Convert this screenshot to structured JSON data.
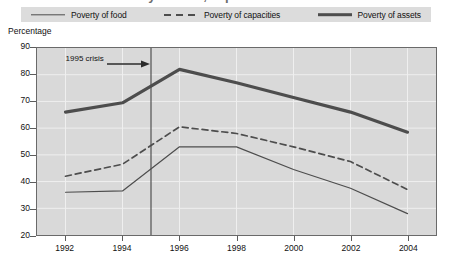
{
  "title": "Poverty of food, capacities and assets",
  "axis_title": "Percentage",
  "legend": [
    {
      "label": "Poverty of food",
      "style": "solid-thin"
    },
    {
      "label": "Poverty of capacities",
      "style": "dashed"
    },
    {
      "label": "Poverty of assets",
      "style": "solid-thick"
    }
  ],
  "annotation": {
    "label": "1995 crisis",
    "at_year": 1995
  },
  "caption": "",
  "colors": {
    "plot_background": "#d9d9d9",
    "legend_background": "#dcdcdc",
    "frame": "#6a6a6a",
    "series_line": "#4d4d4d",
    "gridline": "#efefef",
    "crisis_line": "#5a5a5a",
    "text": "#111111"
  },
  "chart_data": {
    "type": "line",
    "title": "Poverty of food, capacities and assets",
    "xlabel": "",
    "ylabel": "Percentage",
    "x": [
      1992,
      1994,
      1996,
      1998,
      2000,
      2002,
      2004
    ],
    "xticklabels": [
      "1992",
      "1994",
      "1996",
      "1998",
      "2000",
      "2002",
      "2004"
    ],
    "yticklabels": [
      "20",
      "30",
      "40",
      "50",
      "60",
      "70",
      "80",
      "90"
    ],
    "yticks": [
      20,
      30,
      40,
      50,
      60,
      70,
      80,
      90
    ],
    "xlim": [
      1991,
      2005
    ],
    "ylim": [
      20,
      90
    ],
    "grid": true,
    "legend_position": "top",
    "annotations": [
      {
        "text": "1995 crisis",
        "x": 1995,
        "type": "vertical-line-with-arrow"
      }
    ],
    "series": [
      {
        "name": "Poverty of food",
        "style": "solid-thin",
        "values": [
          36,
          36.5,
          53,
          53,
          44.5,
          37.5,
          28
        ]
      },
      {
        "name": "Poverty of capacities",
        "style": "dashed",
        "values": [
          42,
          46.5,
          60.5,
          58,
          53,
          47.5,
          37
        ]
      },
      {
        "name": "Poverty of assets",
        "style": "solid-thick",
        "values": [
          66,
          69.5,
          82,
          77,
          71.5,
          66,
          58.5
        ]
      }
    ]
  }
}
